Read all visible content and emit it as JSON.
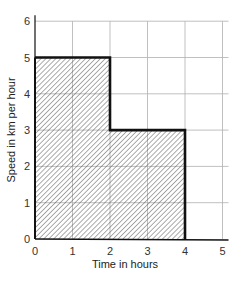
{
  "chart_data": {
    "type": "area",
    "title": "",
    "xlabel": "Time in hours",
    "ylabel": "Speed in km per hour",
    "xlim": [
      0,
      5
    ],
    "ylim": [
      0,
      6
    ],
    "x_ticks": [
      "0",
      "1",
      "2",
      "3",
      "4",
      "5"
    ],
    "y_ticks": [
      "0",
      "1",
      "2",
      "3",
      "4",
      "5",
      "6"
    ],
    "grid": true,
    "fill": "diagonal hatch",
    "series": [
      {
        "name": "Speed",
        "step": true,
        "points": [
          {
            "x": 0,
            "y": 5
          },
          {
            "x": 2,
            "y": 5
          },
          {
            "x": 2,
            "y": 3
          },
          {
            "x": 4,
            "y": 3
          },
          {
            "x": 4,
            "y": 0
          }
        ]
      }
    ],
    "segments": [
      {
        "time_start": 0,
        "time_end": 2,
        "speed": 5
      },
      {
        "time_start": 2,
        "time_end": 4,
        "speed": 3
      }
    ]
  },
  "colors": {
    "grid": "#b0b0b0",
    "outline": "#111111",
    "hatch": "#333333",
    "background": "#ffffff"
  }
}
